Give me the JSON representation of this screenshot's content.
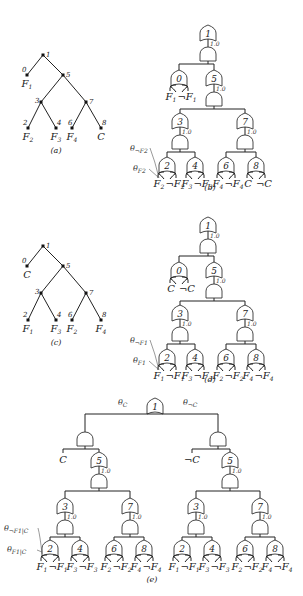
{
  "figure": {
    "panels": [
      {
        "id": "a",
        "caption": "(a)",
        "type": "vtree",
        "nodes": [
          {
            "id": "1",
            "x": 43,
            "y": 55,
            "lx": 3,
            "ly": 2
          },
          {
            "id": "0",
            "x": 27,
            "y": 75,
            "lx": -5,
            "ly": -3,
            "leaf": "F1"
          },
          {
            "id": "5",
            "x": 63,
            "y": 75,
            "lx": 3,
            "ly": 2
          },
          {
            "id": "3",
            "x": 41,
            "y": 102,
            "lx": -6,
            "ly": 1
          },
          {
            "id": "7",
            "x": 86,
            "y": 102,
            "lx": 3,
            "ly": 2
          },
          {
            "id": "2",
            "x": 28,
            "y": 128,
            "lx": -5,
            "ly": -3,
            "leaf": "F2"
          },
          {
            "id": "4",
            "x": 56,
            "y": 128,
            "lx": 1,
            "ly": -3,
            "leaf": "F3"
          },
          {
            "id": "6",
            "x": 72,
            "y": 128,
            "lx": -4,
            "ly": -3,
            "leaf": "F4"
          },
          {
            "id": "8",
            "x": 101,
            "y": 128,
            "lx": 1,
            "ly": -3,
            "leaf": "C"
          }
        ],
        "edges": [
          [
            "1",
            "0"
          ],
          [
            "1",
            "5"
          ],
          [
            "5",
            "3"
          ],
          [
            "5",
            "7"
          ],
          [
            "3",
            "2"
          ],
          [
            "3",
            "4"
          ],
          [
            "7",
            "6"
          ],
          [
            "7",
            "8"
          ]
        ],
        "caption_pos": [
          56,
          153
        ]
      },
      {
        "id": "c",
        "caption": "(c)",
        "type": "vtree",
        "nodes": [
          {
            "id": "1",
            "x": 43,
            "y": 246,
            "lx": 3,
            "ly": 2
          },
          {
            "id": "0",
            "x": 27,
            "y": 266,
            "lx": -5,
            "ly": -3,
            "leaf": "C"
          },
          {
            "id": "5",
            "x": 63,
            "y": 266,
            "lx": 3,
            "ly": 2
          },
          {
            "id": "3",
            "x": 41,
            "y": 293,
            "lx": -6,
            "ly": 1
          },
          {
            "id": "7",
            "x": 86,
            "y": 293,
            "lx": 3,
            "ly": 2
          },
          {
            "id": "2",
            "x": 28,
            "y": 320,
            "lx": -5,
            "ly": -3,
            "leaf": "F1"
          },
          {
            "id": "4",
            "x": 56,
            "y": 320,
            "lx": 1,
            "ly": -3,
            "leaf": "F3"
          },
          {
            "id": "6",
            "x": 72,
            "y": 320,
            "lx": -4,
            "ly": -3,
            "leaf": "F2"
          },
          {
            "id": "8",
            "x": 101,
            "y": 320,
            "lx": 1,
            "ly": -3,
            "leaf": "F4"
          }
        ],
        "edges": [
          [
            "1",
            "0"
          ],
          [
            "1",
            "5"
          ],
          [
            "5",
            "3"
          ],
          [
            "5",
            "7"
          ],
          [
            "3",
            "2"
          ],
          [
            "3",
            "4"
          ],
          [
            "7",
            "6"
          ],
          [
            "7",
            "8"
          ]
        ],
        "caption_pos": [
          56,
          345
        ]
      }
    ],
    "circuits": [
      {
        "id": "b",
        "caption": "(b)",
        "caption_pos": [
          210,
          190
        ],
        "top": {
          "label": "1",
          "x": 208,
          "y": 27,
          "weight": "1.0"
        },
        "left_or": {
          "label": "0",
          "x": 179,
          "y": 72,
          "lits": [
            "F1",
            "¬F1"
          ]
        },
        "right_or": {
          "label": "5",
          "x": 214,
          "y": 72,
          "weight": "1.0"
        },
        "mid": [
          {
            "label": "3",
            "x": 180,
            "y": 115,
            "weight": "1.0"
          },
          {
            "label": "7",
            "x": 245,
            "y": 115,
            "weight": "1.0"
          }
        ],
        "bottom": [
          {
            "label": "2",
            "x": 167,
            "y": 159,
            "lits": [
              "F2",
              "¬F2"
            ]
          },
          {
            "label": "4",
            "x": 195,
            "y": 159,
            "lits": [
              "F3",
              "¬F3"
            ]
          },
          {
            "label": "6",
            "x": 226,
            "y": 159,
            "lits": [
              "F4",
              "¬F4"
            ]
          },
          {
            "label": "8",
            "x": 256,
            "y": 159,
            "lits": [
              "C",
              "¬C"
            ]
          }
        ],
        "thetas": [
          {
            "text": "θ¬F2",
            "x": 130,
            "y": 151
          },
          {
            "text": "θF2",
            "x": 133,
            "y": 171
          }
        ]
      },
      {
        "id": "d",
        "caption": "(d)",
        "caption_pos": [
          210,
          382
        ],
        "top": {
          "label": "1",
          "x": 208,
          "y": 219,
          "weight": "1.0"
        },
        "left_or": {
          "label": "0",
          "x": 179,
          "y": 264,
          "lits": [
            "C",
            "¬C"
          ]
        },
        "right_or": {
          "label": "5",
          "x": 214,
          "y": 264,
          "weight": "1.0"
        },
        "mid": [
          {
            "label": "3",
            "x": 180,
            "y": 307,
            "weight": "1.0"
          },
          {
            "label": "7",
            "x": 245,
            "y": 307,
            "weight": "1.0"
          }
        ],
        "bottom": [
          {
            "label": "2",
            "x": 167,
            "y": 351,
            "lits": [
              "F1",
              "¬F1"
            ]
          },
          {
            "label": "4",
            "x": 195,
            "y": 351,
            "lits": [
              "F3",
              "¬F3"
            ]
          },
          {
            "label": "6",
            "x": 226,
            "y": 351,
            "lits": [
              "F2",
              "¬F2"
            ]
          },
          {
            "label": "8",
            "x": 256,
            "y": 351,
            "lits": [
              "F4",
              "¬F4"
            ]
          }
        ],
        "thetas": [
          {
            "text": "θ¬F1",
            "x": 130,
            "y": 343
          },
          {
            "text": "θF1",
            "x": 133,
            "y": 363
          }
        ]
      }
    ],
    "panel_e": {
      "caption": "(e)",
      "caption_pos": [
        152,
        582
      ],
      "top": {
        "label": "1",
        "x": 155,
        "y": 408
      },
      "theta_left": {
        "text": "θC",
        "x": 118,
        "y": 415
      },
      "theta_right": {
        "text": "θ¬C",
        "x": 183,
        "y": 415
      },
      "halves": [
        {
          "and_x": 85,
          "and_y": 432,
          "lit": "C",
          "lit_x": 63,
          "or5_x": 99,
          "bottom": [
            {
              "label": "3",
              "x": 65,
              "weight": "1.0"
            },
            {
              "label": "7",
              "x": 130,
              "weight": "1.0"
            }
          ],
          "leaves": [
            {
              "label": "2",
              "x": 50,
              "lits": [
                "F1",
                "¬F1"
              ]
            },
            {
              "label": "4",
              "x": 80,
              "lits": [
                "F3",
                "¬F3"
              ]
            },
            {
              "label": "6",
              "x": 114,
              "lits": [
                "F2",
                "¬F2"
              ]
            },
            {
              "label": "8",
              "x": 144,
              "lits": [
                "F4",
                "¬F4"
              ]
            }
          ]
        },
        {
          "and_x": 218,
          "and_y": 432,
          "lit": "¬C",
          "lit_x": 192,
          "or5_x": 230,
          "bottom": [
            {
              "label": "3",
              "x": 196,
              "weight": "1.0"
            },
            {
              "label": "7",
              "x": 260,
              "weight": "1.0"
            }
          ],
          "leaves": [
            {
              "label": "2",
              "x": 182,
              "lits": [
                "F1",
                "¬F1"
              ]
            },
            {
              "label": "4",
              "x": 212,
              "lits": [
                "F3",
                "¬F3"
              ]
            },
            {
              "label": "6",
              "x": 245,
              "lits": [
                "F2",
                "¬F2"
              ]
            },
            {
              "label": "8",
              "x": 275,
              "lits": [
                "F4",
                "¬F4"
              ]
            }
          ]
        }
      ],
      "thetas": [
        {
          "text": "θ¬F1|C",
          "x": 4,
          "y": 531
        },
        {
          "text": "θF1|C",
          "x": 7,
          "y": 552
        }
      ]
    }
  }
}
